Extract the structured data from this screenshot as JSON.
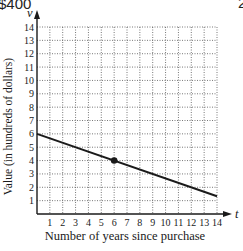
{
  "header": {
    "left_partial_text": "$400",
    "right_partial_text": "2"
  },
  "chart_data": {
    "type": "line",
    "title": "",
    "xlabel": "Number of years since purchase",
    "ylabel": "Value (in hundreds of dollars)",
    "x_axis_var": "t",
    "y_axis_var": "v",
    "xlim": [
      0,
      14
    ],
    "ylim": [
      0,
      14
    ],
    "x_ticks": [
      1,
      2,
      3,
      4,
      5,
      6,
      7,
      8,
      9,
      10,
      11,
      12,
      13,
      14
    ],
    "y_ticks": [
      1,
      2,
      3,
      4,
      5,
      6,
      7,
      8,
      9,
      10,
      11,
      12,
      13,
      14
    ],
    "grid": true,
    "grid_style": "dotted",
    "series": [
      {
        "name": "value",
        "x": [
          0,
          14
        ],
        "y": [
          6,
          1.33
        ],
        "equation": "v = 6 - t/3"
      }
    ],
    "points": [
      {
        "x": 6,
        "y": 4,
        "style": "filled-dot"
      }
    ],
    "colors": {
      "line": "#1a1a1a",
      "grid": "#555555",
      "background": "#ffffff"
    }
  }
}
